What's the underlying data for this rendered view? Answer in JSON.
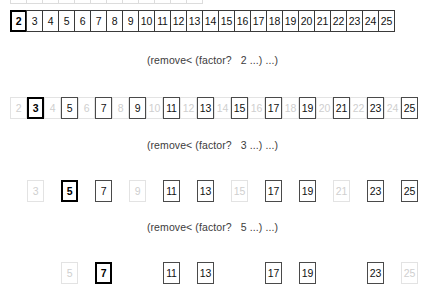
{
  "figure": {
    "title_semantic": "sieve-of-eratosthenes-filter-steps",
    "colors": {
      "background": "#ffffff",
      "cell_border": "#4a4a4a",
      "pivot_border": "#000000",
      "removed_border": "#e3e3e3",
      "text": "#111111",
      "removed_text": "#cfcfcf",
      "caption_text": "#3c3c3c"
    },
    "cell_width_px": 17,
    "cell_height_px": 22,
    "row_start_x_px": 10
  },
  "clipped_top_row": {
    "note": "partially cut off at top edge of screenshot",
    "cells": [
      {
        "label": "2",
        "state": "active"
      },
      {
        "label": "3",
        "state": "active"
      },
      {
        "label": "4",
        "state": "active"
      },
      {
        "label": "5",
        "state": "active"
      },
      {
        "label": "6",
        "state": "active"
      },
      {
        "label": "7",
        "state": "active"
      },
      {
        "label": "8",
        "state": "active"
      },
      {
        "label": "9",
        "state": "active"
      },
      {
        "label": "10",
        "state": "active"
      },
      {
        "label": "11",
        "state": "active"
      },
      {
        "label": "12",
        "state": "active"
      },
      {
        "label": "13",
        "state": "active"
      }
    ]
  },
  "rows": [
    {
      "id": "row-initial",
      "layout": "contiguous",
      "top_px": 10,
      "offset_cols": 0,
      "cells": [
        {
          "label": "2",
          "state": "pivot"
        },
        {
          "label": "3",
          "state": "active"
        },
        {
          "label": "4",
          "state": "active"
        },
        {
          "label": "5",
          "state": "active"
        },
        {
          "label": "6",
          "state": "active"
        },
        {
          "label": "7",
          "state": "active"
        },
        {
          "label": "8",
          "state": "active"
        },
        {
          "label": "9",
          "state": "active"
        },
        {
          "label": "10",
          "state": "active"
        },
        {
          "label": "11",
          "state": "active"
        },
        {
          "label": "12",
          "state": "active"
        },
        {
          "label": "13",
          "state": "active"
        },
        {
          "label": "14",
          "state": "active"
        },
        {
          "label": "15",
          "state": "active"
        },
        {
          "label": "16",
          "state": "active"
        },
        {
          "label": "17",
          "state": "active"
        },
        {
          "label": "18",
          "state": "active"
        },
        {
          "label": "19",
          "state": "active"
        },
        {
          "label": "20",
          "state": "active"
        },
        {
          "label": "21",
          "state": "active"
        },
        {
          "label": "22",
          "state": "active"
        },
        {
          "label": "23",
          "state": "active"
        },
        {
          "label": "24",
          "state": "active"
        },
        {
          "label": "25",
          "state": "active"
        }
      ]
    },
    {
      "id": "row-after-2",
      "layout": "spaced",
      "top_px": 97,
      "offset_cols": 0,
      "cells": [
        {
          "label": "2",
          "state": "removed"
        },
        {
          "label": "3",
          "state": "pivot"
        },
        {
          "label": "4",
          "state": "removed"
        },
        {
          "label": "5",
          "state": "active"
        },
        {
          "label": "6",
          "state": "removed"
        },
        {
          "label": "7",
          "state": "active"
        },
        {
          "label": "8",
          "state": "removed"
        },
        {
          "label": "9",
          "state": "active"
        },
        {
          "label": "10",
          "state": "removed"
        },
        {
          "label": "11",
          "state": "active"
        },
        {
          "label": "12",
          "state": "removed"
        },
        {
          "label": "13",
          "state": "active"
        },
        {
          "label": "14",
          "state": "removed"
        },
        {
          "label": "15",
          "state": "active"
        },
        {
          "label": "16",
          "state": "removed"
        },
        {
          "label": "17",
          "state": "active"
        },
        {
          "label": "18",
          "state": "removed"
        },
        {
          "label": "19",
          "state": "active"
        },
        {
          "label": "20",
          "state": "removed"
        },
        {
          "label": "21",
          "state": "active"
        },
        {
          "label": "22",
          "state": "removed"
        },
        {
          "label": "23",
          "state": "active"
        },
        {
          "label": "24",
          "state": "removed"
        },
        {
          "label": "25",
          "state": "active"
        }
      ]
    },
    {
      "id": "row-after-3",
      "layout": "spaced",
      "top_px": 180,
      "offset_cols": 1,
      "cells": [
        {
          "label": "3",
          "state": "removed"
        },
        {
          "label": "4",
          "state": "gap"
        },
        {
          "label": "5",
          "state": "pivot"
        },
        {
          "label": "6",
          "state": "gap"
        },
        {
          "label": "7",
          "state": "active"
        },
        {
          "label": "8",
          "state": "gap"
        },
        {
          "label": "9",
          "state": "removed"
        },
        {
          "label": "10",
          "state": "gap"
        },
        {
          "label": "11",
          "state": "active"
        },
        {
          "label": "12",
          "state": "gap"
        },
        {
          "label": "13",
          "state": "active"
        },
        {
          "label": "14",
          "state": "gap"
        },
        {
          "label": "15",
          "state": "removed"
        },
        {
          "label": "16",
          "state": "gap"
        },
        {
          "label": "17",
          "state": "active"
        },
        {
          "label": "18",
          "state": "gap"
        },
        {
          "label": "19",
          "state": "active"
        },
        {
          "label": "20",
          "state": "gap"
        },
        {
          "label": "21",
          "state": "removed"
        },
        {
          "label": "22",
          "state": "gap"
        },
        {
          "label": "23",
          "state": "active"
        },
        {
          "label": "24",
          "state": "gap"
        },
        {
          "label": "25",
          "state": "active"
        }
      ]
    },
    {
      "id": "row-after-5",
      "layout": "spaced",
      "top_px": 262,
      "offset_cols": 3,
      "cells": [
        {
          "label": "5",
          "state": "removed"
        },
        {
          "label": "6",
          "state": "gap"
        },
        {
          "label": "7",
          "state": "pivot"
        },
        {
          "label": "8",
          "state": "gap"
        },
        {
          "label": "9",
          "state": "gap"
        },
        {
          "label": "10",
          "state": "gap"
        },
        {
          "label": "11",
          "state": "active"
        },
        {
          "label": "12",
          "state": "gap"
        },
        {
          "label": "13",
          "state": "active"
        },
        {
          "label": "14",
          "state": "gap"
        },
        {
          "label": "15",
          "state": "gap"
        },
        {
          "label": "16",
          "state": "gap"
        },
        {
          "label": "17",
          "state": "active"
        },
        {
          "label": "18",
          "state": "gap"
        },
        {
          "label": "19",
          "state": "active"
        },
        {
          "label": "20",
          "state": "gap"
        },
        {
          "label": "21",
          "state": "gap"
        },
        {
          "label": "22",
          "state": "gap"
        },
        {
          "label": "23",
          "state": "active"
        },
        {
          "label": "24",
          "state": "gap"
        },
        {
          "label": "25",
          "state": "removed"
        }
      ]
    }
  ],
  "captions": [
    {
      "id": "caption-factor-2",
      "top_px": 54,
      "text": "(remove< (factor?   2 ...) ...)"
    },
    {
      "id": "caption-factor-3",
      "top_px": 139,
      "text": "(remove< (factor?   3 ...) ...)"
    },
    {
      "id": "caption-factor-5",
      "top_px": 221,
      "text": "(remove< (factor?   5 ...) ...)"
    }
  ]
}
